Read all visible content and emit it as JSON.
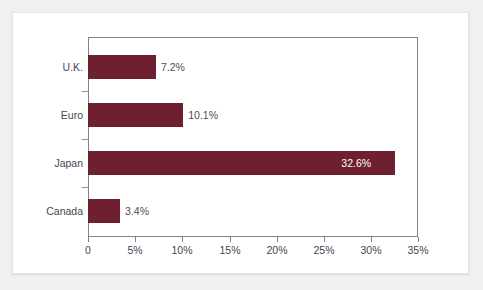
{
  "chart_data": {
    "type": "bar",
    "orientation": "horizontal",
    "title": "",
    "subtitle": "",
    "xlabel": "",
    "ylabel": "",
    "categories": [
      "U.K.",
      "Euro",
      "Japan",
      "Canada"
    ],
    "values": [
      7.2,
      10.1,
      32.6,
      3.4
    ],
    "value_labels": [
      "7.2%",
      "10.1%",
      "32.6%",
      "3.4%"
    ],
    "label_placement": [
      "outside",
      "outside",
      "inside",
      "outside"
    ],
    "xlim": [
      0,
      35
    ],
    "xticks": [
      0,
      5,
      10,
      15,
      20,
      25,
      30,
      35
    ],
    "xtick_labels": [
      "0",
      "5%",
      "10%",
      "15%",
      "20%",
      "25%",
      "30%",
      "35%"
    ],
    "grid": false,
    "legend": null,
    "series": [
      {
        "name": "Share",
        "values": [
          7.2,
          10.1,
          32.6,
          3.4
        ],
        "color": "#6e2030"
      }
    ],
    "colors": {
      "bar": "#6e2030",
      "axis": "#7c8490",
      "text": "#3f464e",
      "inside_label": "#ffffff",
      "plot_background": "#ffffff",
      "page_background": "#eef0f2"
    }
  }
}
